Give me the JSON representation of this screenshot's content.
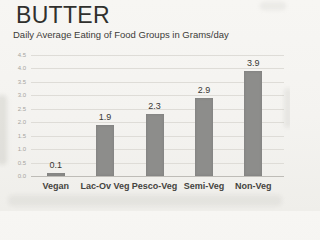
{
  "chart_data": {
    "type": "bar",
    "title": "BUTTER",
    "subtitle": "Daily Average Eating of Food Groups in Grams/day",
    "categories": [
      "Vegan",
      "Lac-Ov Veg",
      "Pesco-Veg",
      "Semi-Veg",
      "Non-Veg"
    ],
    "values": [
      0.1,
      1.9,
      2.3,
      2.9,
      3.9
    ],
    "data_labels": [
      "0.1",
      "1.9",
      "2.3",
      "2.9",
      "3.9"
    ],
    "xlabel": "",
    "ylabel": "",
    "ylim": [
      0,
      4.5
    ],
    "ytick_step": 0.5,
    "ytick_labels": [
      "0.0",
      "0.5",
      "1.0",
      "1.5",
      "2.0",
      "2.5",
      "3.0",
      "3.5",
      "4.0",
      "4.5"
    ],
    "grid": true,
    "legend": "none",
    "colors": {
      "bar": "#8d8d8b",
      "gridline": "#dedcd7",
      "axis_line": "#bebcb7",
      "ytick_text": "#a6a5a0",
      "title_text": "#30302d",
      "label_text": "#393835",
      "paper": "#f4f3f0"
    }
  }
}
